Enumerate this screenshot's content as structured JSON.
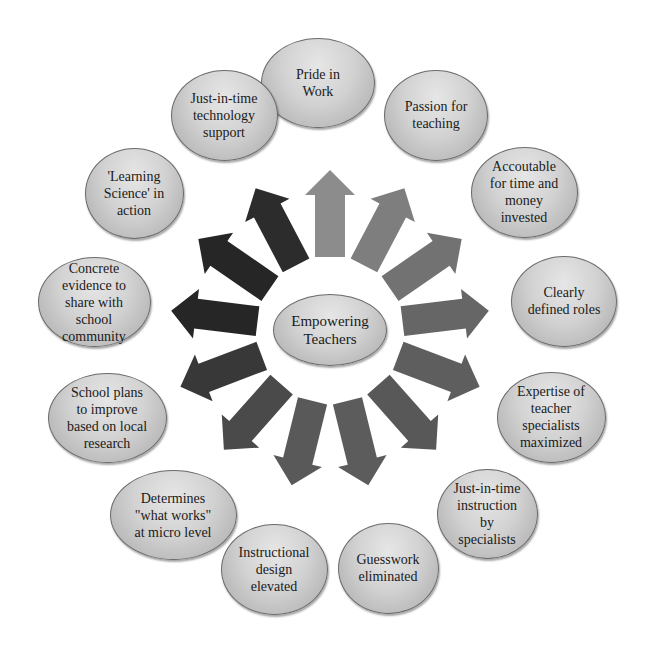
{
  "diagram": {
    "center": {
      "label": "Empowering\nTeachers",
      "cx": 330,
      "cy": 330,
      "w": 114,
      "h": 72
    },
    "arrows": {
      "count": 13,
      "inner_radius": 73,
      "outer_radius": 160,
      "shaft_width": 30,
      "head_width": 50,
      "head_length": 25,
      "colors": [
        "#8c8c8c",
        "#7e7e7e",
        "#727272",
        "#666666",
        "#5e5e5e",
        "#585858",
        "#5c5c5c",
        "#595959",
        "#4a4a4a",
        "#383838",
        "#262626",
        "#262626",
        "#2c2c2c"
      ]
    },
    "nodes": [
      {
        "label": "Pride in\nWork",
        "cx": 318,
        "cy": 83,
        "w": 114,
        "h": 90
      },
      {
        "label": "Passion for\nteaching",
        "cx": 436,
        "cy": 115,
        "w": 104,
        "h": 91
      },
      {
        "label": "Accoutable\nfor time and\nmoney\ninvested",
        "cx": 524,
        "cy": 192,
        "w": 107,
        "h": 91
      },
      {
        "label": "Clearly\ndefined roles",
        "cx": 564,
        "cy": 301,
        "w": 106,
        "h": 91
      },
      {
        "label": "Expertise of\nteacher\nspecialists\nmaximized",
        "cx": 551,
        "cy": 417,
        "w": 109,
        "h": 91
      },
      {
        "label": "Just-in-time\ninstruction\nby\nspecialists",
        "cx": 487,
        "cy": 514,
        "w": 101,
        "h": 90
      },
      {
        "label": "Guesswork\neliminated",
        "cx": 388,
        "cy": 568,
        "w": 101,
        "h": 91
      },
      {
        "label": "Instructional\ndesign\nelevated",
        "cx": 274,
        "cy": 569,
        "w": 107,
        "h": 91
      },
      {
        "label": "Determines\n\"what works\"\nat micro level",
        "cx": 173,
        "cy": 515,
        "w": 127,
        "h": 90
      },
      {
        "label": "School plans\nto improve\nbased on local\nresearch",
        "cx": 107,
        "cy": 418,
        "w": 119,
        "h": 90
      },
      {
        "label": "Concrete\nevidence to\nshare with\nschool\ncommunity",
        "cx": 94,
        "cy": 302,
        "w": 113,
        "h": 90
      },
      {
        "label": "'Learning\nScience' in\naction",
        "cx": 134,
        "cy": 193,
        "w": 99,
        "h": 91
      },
      {
        "label": "Just-in-time\ntechnology\nsupport",
        "cx": 224,
        "cy": 115,
        "w": 107,
        "h": 91
      }
    ]
  }
}
